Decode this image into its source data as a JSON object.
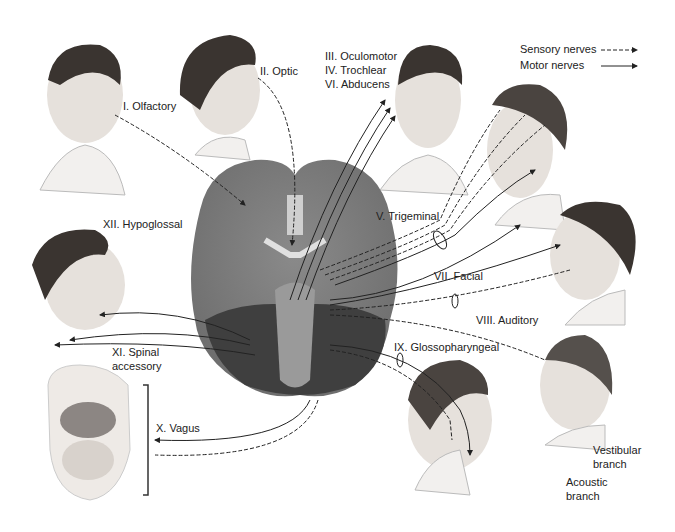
{
  "legend": {
    "sensory": "Sensory nerves",
    "motor": "Motor nerves"
  },
  "nerves": {
    "olfactory": "I. Olfactory",
    "optic": "II. Optic",
    "oculomotor": "III. Oculomotor",
    "trochlear": "IV. Trochlear",
    "abducens": "VI. Abducens",
    "trigeminal": "V. Trigeminal",
    "facial": "VII. Facial",
    "auditory": "VIII. Auditory",
    "glossopharyngeal": "IX. Glossopharyngeal",
    "vagus": "X. Vagus",
    "spinal_1": "XI. Spinal",
    "spinal_2": "accessory",
    "hypoglossal": "XII. Hypoglossal",
    "vestibular_1": "Vestibular",
    "vestibular_2": "branch",
    "acoustic_1": "Acoustic",
    "acoustic_2": "branch"
  },
  "colors": {
    "brain": "#7a7a7a",
    "brain_dark": "#4a4a4a",
    "skin": "#e8e3df",
    "hair": "#3a3430",
    "line": "#222222"
  }
}
